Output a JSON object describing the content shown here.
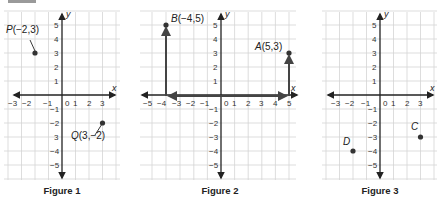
{
  "figures": [
    {
      "caption": "Figure 1",
      "x_axis_label": "x",
      "y_axis_label": "y",
      "x_ticks": [
        "-3",
        "-2",
        "-1",
        "0",
        "1",
        "2",
        "3"
      ],
      "y_ticks": [
        "5",
        "4",
        "3",
        "2",
        "1",
        "-1",
        "-2",
        "-3",
        "-4",
        "-5"
      ],
      "points": [
        {
          "name": "P",
          "label": "P(−2, 3)",
          "x": -2,
          "y": 3
        },
        {
          "name": "Q",
          "label": "Q(3, −2)",
          "x": 3,
          "y": -2
        }
      ]
    },
    {
      "caption": "Figure 2",
      "x_axis_label": "x",
      "y_axis_label": "y",
      "x_ticks": [
        "-5",
        "-4",
        "-3",
        "-2",
        "-1",
        "0",
        "1",
        "2",
        "3",
        "4",
        "5"
      ],
      "y_ticks": [
        "5",
        "4",
        "3",
        "2",
        "1",
        "-1",
        "-2",
        "-3",
        "-4",
        "-5"
      ],
      "points": [
        {
          "name": "B",
          "label": "B(−4, 5)",
          "x": -4,
          "y": 5
        },
        {
          "name": "A",
          "label": "A(5, 3)",
          "x": 5,
          "y": 3
        }
      ],
      "paths": [
        {
          "description": "Path from origin left along x-axis to -4 then up to B(-4,5)"
        },
        {
          "description": "Path from origin right along x-axis to 5 then up to A(5,3)"
        }
      ]
    },
    {
      "caption": "Figure 3",
      "x_axis_label": "x",
      "y_axis_label": "y",
      "x_ticks": [
        "-3",
        "-2",
        "-1",
        "0",
        "1",
        "2",
        "3"
      ],
      "y_ticks": [
        "5",
        "4",
        "3",
        "2",
        "1",
        "-1",
        "-2",
        "-3",
        "-4",
        "-5"
      ],
      "points": [
        {
          "name": "C",
          "label": "C",
          "x": 3,
          "y": -3
        },
        {
          "name": "D",
          "label": "D",
          "x": -2,
          "y": -4
        }
      ]
    }
  ],
  "labels": {
    "p_name": "P",
    "p_coords": "(−2,3)",
    "q_name": "Q",
    "q_coords": "(3,−2)",
    "b_name": "B",
    "b_coords": "(−4,5)",
    "a_name": "A",
    "a_coords": "(5,3)",
    "c_name": "C",
    "d_name": "D"
  }
}
